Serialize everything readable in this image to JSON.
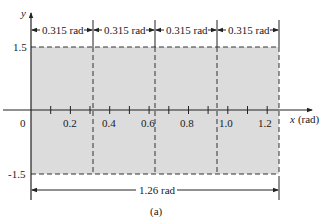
{
  "figure": {
    "caption": "(a)",
    "y_axis": {
      "label": "y",
      "ticks": [
        "1.5",
        "-1.5"
      ]
    },
    "x_axis": {
      "label_var": "x",
      "label_unit": "(rad)",
      "ticks": [
        "0.2",
        "0.4",
        "0.6",
        "0.8",
        "1.0",
        "1.2"
      ],
      "origin": "0"
    },
    "segments": [
      "0.315 rad",
      "0.315 rad",
      "0.315 rad",
      "0.315 rad"
    ],
    "total_width": "1.26 rad",
    "fill_color": "#dcdcdc",
    "line_color": "#333333"
  }
}
